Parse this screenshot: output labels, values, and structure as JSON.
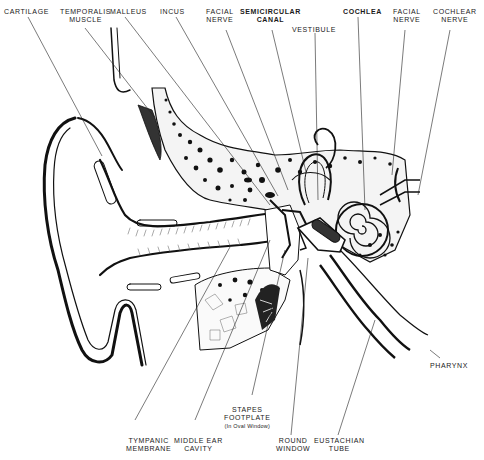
{
  "diagram": {
    "labels_top": [
      {
        "id": "cartilage",
        "lines": [
          "CARTILAGE"
        ]
      },
      {
        "id": "temporalis-muscle",
        "lines": [
          "TEMPORALIS",
          "MUSCLE"
        ]
      },
      {
        "id": "malleus",
        "lines": [
          "MALLEUS"
        ]
      },
      {
        "id": "incus",
        "lines": [
          "INCUS"
        ]
      },
      {
        "id": "facial-nerve-1",
        "lines": [
          "FACIAL",
          "NERVE"
        ]
      },
      {
        "id": "semicircular-canal",
        "lines": [
          "SEMICIRCULAR",
          "CANAL"
        ]
      },
      {
        "id": "vestibule",
        "lines": [
          "VESTIBULE"
        ]
      },
      {
        "id": "cochlea",
        "lines": [
          "COCHLEA"
        ]
      },
      {
        "id": "facial-nerve-2",
        "lines": [
          "FACIAL",
          "NERVE"
        ]
      },
      {
        "id": "cochlear-nerve",
        "lines": [
          "COCHLEAR",
          "NERVE"
        ]
      }
    ],
    "labels_bottom": [
      {
        "id": "tympanic-membrane",
        "lines": [
          "TYMPANIC",
          "MEMBRANE"
        ]
      },
      {
        "id": "middle-ear-cavity",
        "lines": [
          "MIDDLE EAR",
          "CAVITY"
        ]
      },
      {
        "id": "stapes-footplate",
        "lines": [
          "STAPES",
          "FOOTPLATE"
        ],
        "note": "(In Oval Window)"
      },
      {
        "id": "round-window",
        "lines": [
          "ROUND",
          "WINDOW"
        ]
      },
      {
        "id": "eustachian-tube",
        "lines": [
          "EUSTACHIAN",
          "TUBE"
        ]
      }
    ],
    "labels_side": [
      {
        "id": "pharynx",
        "lines": [
          "PHARYNX"
        ]
      }
    ]
  }
}
